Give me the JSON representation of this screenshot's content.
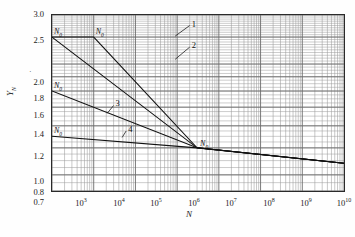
{
  "chart_data": {
    "type": "line",
    "title": "",
    "xlabel": "N",
    "ylabel": "Y_N",
    "xscale": "log",
    "yscale": "log",
    "xlim": [
      1000,
      10000000000
    ],
    "ylim": [
      0.7,
      3.0
    ],
    "grid": true,
    "legend": "none",
    "x_tick_labels": [
      "10^3",
      "10^4",
      "10^5",
      "10^6",
      "10^7",
      "10^8",
      "10^9",
      "10^10"
    ],
    "x_tick_values": [
      1000,
      10000,
      100000,
      1000000,
      10000000,
      100000000,
      1000000000,
      10000000000
    ],
    "y_tick_labels": [
      "3.0",
      "2.5",
      "2.0",
      "1.8",
      "1.6",
      "1.4",
      "1.2",
      "1.0",
      "0.8",
      "0.7"
    ],
    "y_tick_values": [
      3.0,
      2.5,
      2.0,
      1.8,
      1.6,
      1.4,
      1.2,
      1.0,
      0.8,
      0.7
    ],
    "convergence_point": {
      "x": 3000000,
      "y": 1.0,
      "label": "N_0"
    },
    "series": [
      {
        "name": "1",
        "label": "1",
        "knee_label": "N_0",
        "knee_x": 1000,
        "knee_y": 2.5,
        "points": [
          [
            1000,
            2.5
          ],
          [
            3000000,
            1.0
          ],
          [
            10000000000,
            0.88
          ]
        ]
      },
      {
        "name": "2",
        "label": "2",
        "knee_label": "N_0",
        "knee_x": 10000,
        "knee_y": 2.5,
        "points": [
          [
            10000,
            2.5
          ],
          [
            3000000,
            1.0
          ],
          [
            10000000000,
            0.88
          ]
        ]
      },
      {
        "name": "3",
        "label": "3",
        "knee_label": "N_0",
        "knee_x": 1000,
        "knee_y": 1.6,
        "points": [
          [
            1000,
            1.6
          ],
          [
            3000000,
            1.0
          ],
          [
            10000000000,
            0.88
          ]
        ]
      },
      {
        "name": "4",
        "label": "4",
        "knee_label": "N_0",
        "knee_x": 1000,
        "knee_y": 1.1,
        "points": [
          [
            1000,
            1.1
          ],
          [
            3000000,
            1.0
          ],
          [
            10000000000,
            0.88
          ]
        ]
      }
    ],
    "flat_segments": [
      {
        "series": "1",
        "from_x": 1000,
        "to_x": 1000,
        "y": 2.5
      },
      {
        "series": "2",
        "from_x": 1000,
        "to_x": 10000,
        "y": 2.5
      },
      {
        "series": "3",
        "from_x": 1000,
        "to_x": 1000,
        "y": 1.6
      },
      {
        "series": "4",
        "from_x": 1000,
        "to_x": 1000,
        "y": 1.1
      }
    ],
    "annotations": [
      {
        "text": "N_0",
        "x": 1000,
        "y": 2.5,
        "for": "1"
      },
      {
        "text": "N_0",
        "x": 10000,
        "y": 2.5,
        "for": "2"
      },
      {
        "text": "N_0",
        "x": 1000,
        "y": 1.6,
        "for": "3"
      },
      {
        "text": "N_0",
        "x": 1000,
        "y": 1.1,
        "for": "4"
      },
      {
        "text": "N_0",
        "x": 3000000,
        "y": 1.0,
        "for": "convergence"
      },
      {
        "text": "1",
        "x": 2000000,
        "y": 2.75,
        "for": "1"
      },
      {
        "text": "2",
        "x": 2000000,
        "y": 2.3,
        "for": "2"
      },
      {
        "text": "3",
        "x": 30000,
        "y": 1.42,
        "for": "3"
      },
      {
        "text": "4",
        "x": 60000,
        "y": 1.15,
        "for": "4"
      }
    ]
  },
  "axes": {
    "y_title": "Y",
    "y_title_sub": "N",
    "x_title": "N",
    "y_labels": [
      "3.0",
      "2.5",
      "2.0",
      "1.8",
      "1.6",
      "1.4",
      "1.2",
      "1.0",
      "0.8",
      "0.7"
    ],
    "x_labels": [
      {
        "base": "10",
        "exp": "3"
      },
      {
        "base": "10",
        "exp": "4"
      },
      {
        "base": "10",
        "exp": "5"
      },
      {
        "base": "10",
        "exp": "6"
      },
      {
        "base": "10",
        "exp": "7"
      },
      {
        "base": "10",
        "exp": "8"
      },
      {
        "base": "10",
        "exp": "9"
      },
      {
        "base": "10",
        "exp": "10"
      }
    ]
  },
  "curve_numbers": [
    "1",
    "2",
    "3",
    "4"
  ],
  "knee_symbol": "N",
  "knee_symbol_sub": "0",
  "colors": {
    "curve": "#111111",
    "axis": "#2a2a2a",
    "grid_major": "#6b6b6b",
    "grid_minor": "#9a9a9a",
    "background": "#ffffff",
    "text": "#1a1a1a"
  }
}
